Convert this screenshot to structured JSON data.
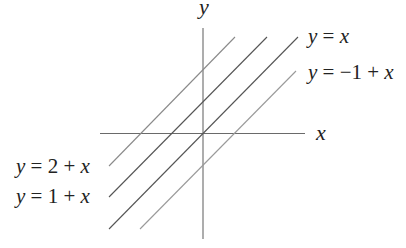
{
  "diagram": {
    "axes": {
      "x_label": "x",
      "y_label": "y",
      "origin_px": [
        203,
        133.5
      ],
      "unit_px": 31.5,
      "color": "#6a6a6a"
    },
    "lines": [
      {
        "id": "y-eq-2-plus-x",
        "equation": "y = 2 + x",
        "intercept": 2,
        "slope": 1,
        "x1": 109,
        "y1": 166,
        "x2": 235,
        "y2": 37,
        "color": "#8a8a8a"
      },
      {
        "id": "y-eq-1-plus-x",
        "equation": "y = 1 + x",
        "intercept": 1,
        "slope": 1,
        "x1": 109,
        "y1": 197,
        "x2": 267,
        "y2": 37,
        "color": "#555555"
      },
      {
        "id": "y-eq-x",
        "equation": "y = x",
        "intercept": 0,
        "slope": 1,
        "x1": 109,
        "y1": 229,
        "x2": 298,
        "y2": 37,
        "color": "#555555"
      },
      {
        "id": "y-eq-minus1-plus-x",
        "equation": "y = −1 + x",
        "intercept": -1,
        "slope": 1,
        "x1": 140,
        "y1": 229,
        "x2": 296,
        "y2": 71,
        "color": "#9a9a9a"
      }
    ],
    "labels": {
      "y_eq_x": {
        "y": "y",
        "eq": " = ",
        "rhs_pre": "",
        "rhs_var": "x"
      },
      "y_eq_minus1_plus_x": {
        "y": "y",
        "eq": " = ",
        "rhs_pre": "−1 + ",
        "rhs_var": "x"
      },
      "y_eq_2_plus_x": {
        "y": "y",
        "eq": " = ",
        "rhs_pre": "2 + ",
        "rhs_var": "x"
      },
      "y_eq_1_plus_x": {
        "y": "y",
        "eq": " = ",
        "rhs_pre": "1 + ",
        "rhs_var": "x"
      }
    }
  }
}
